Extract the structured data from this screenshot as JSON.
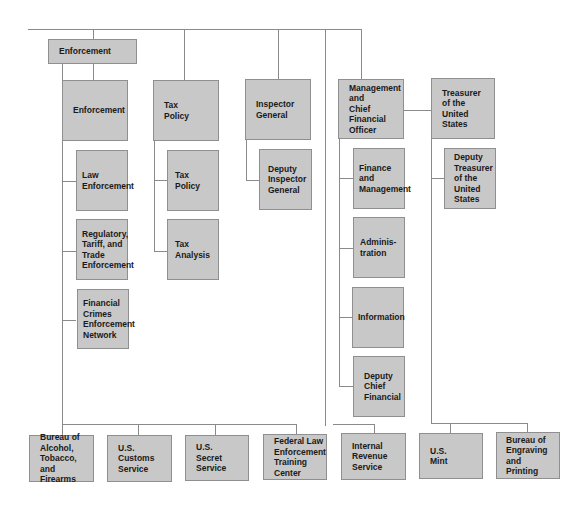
{
  "org_chart": {
    "top_row": {
      "enforcement_group": "Enforcement",
      "enforcement": "Enforcement",
      "tax_policy": "Tax\nPolicy",
      "inspector_general": "Inspector\nGeneral",
      "management_cfo": "Management\nand\nChief\nFinancial\nOfficer",
      "treasurer": "Treasurer\nof the\nUnited\nStates"
    },
    "enforcement_children": [
      "Law\nEnforcement",
      "Regulatory,\nTariff, and\nTrade\nEnforcement",
      "Financial\nCrimes\nEnforcement\nNetwork"
    ],
    "tax_policy_children": [
      "Tax\nPolicy",
      "Tax\nAnalysis"
    ],
    "inspector_general_children": [
      "Deputy\nInspector\nGeneral"
    ],
    "management_children": [
      "Finance\nand\nManagement",
      "Adminis-\ntration",
      "Information",
      "Deputy\nChief\nFinancial"
    ],
    "treasurer_children": [
      "Deputy\nTreasurer\nof the\nUnited\nStates"
    ],
    "bureaus": [
      "Bureau of\nAlcohol,\nTobacco,\nand Firearms",
      "U.S.\nCustoms\nService",
      "U.S.\nSecret\nService",
      "Federal Law\nEnforcement\nTraining\nCenter",
      "Internal\nRevenue\nService",
      "U.S.\nMint",
      "Bureau of\nEngraving\nand\nPrinting"
    ]
  }
}
